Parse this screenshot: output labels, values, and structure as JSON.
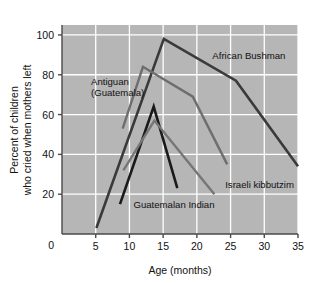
{
  "chart_data": {
    "type": "line",
    "title": "",
    "xlabel": "Age (months)",
    "ylabel": "Percent of children who cried when mothers left",
    "ylabel_line1": "Percent of children",
    "ylabel_line2": "who cried when mothers left",
    "xlim": [
      0,
      35
    ],
    "ylim": [
      0,
      105
    ],
    "xticks": [
      0,
      5,
      10,
      15,
      20,
      25,
      30,
      35
    ],
    "yticks": [
      0,
      20,
      40,
      60,
      80,
      100
    ],
    "xtick_labels": [
      "0",
      "5",
      "10",
      "15",
      "20",
      "25",
      "30",
      "35"
    ],
    "ytick_labels": [
      "0",
      "20",
      "40",
      "60",
      "80",
      "100"
    ],
    "grid": true,
    "grid_color": "#ffffff",
    "plot_background": "#b6b6b6",
    "legend": "inline-annotations",
    "series": [
      {
        "name": "African Bushman",
        "color": "#3a3a3a",
        "width": 2.6,
        "points": [
          [
            5.1,
            3
          ],
          [
            15.1,
            98
          ],
          [
            25.8,
            77
          ],
          [
            35.0,
            34
          ]
        ],
        "label_x": 22.3,
        "label_y": 88
      },
      {
        "name": "Antiguan (Guatemala)",
        "color": "#6e6e6e",
        "width": 2.4,
        "points": [
          [
            9.0,
            53
          ],
          [
            12.0,
            84
          ],
          [
            19.4,
            69
          ],
          [
            24.5,
            35
          ]
        ],
        "label_x": 4.3,
        "label_y": 75,
        "label_line1": "Antiguan",
        "label_line2": "(Guatemala)"
      },
      {
        "name": "Guatemalan Indian",
        "color": "#1a1a1a",
        "width": 2.6,
        "points": [
          [
            8.6,
            15
          ],
          [
            13.6,
            64
          ],
          [
            17.1,
            23
          ]
        ],
        "label_x": 10.6,
        "label_y": 13
      },
      {
        "name": "Israeli kibbutzim",
        "color": "#767676",
        "width": 2.4,
        "points": [
          [
            9.1,
            32
          ],
          [
            13.7,
            57
          ],
          [
            22.6,
            20
          ]
        ],
        "label_x": 24.2,
        "label_y": 23
      }
    ]
  }
}
